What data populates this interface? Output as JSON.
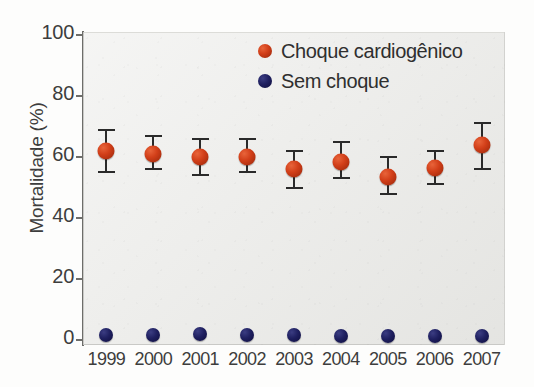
{
  "chart_data": {
    "type": "scatter",
    "title": "",
    "xlabel": "",
    "ylabel": "Mortalidade (%)",
    "categories": [
      "1999",
      "2000",
      "2001",
      "2002",
      "2003",
      "2004",
      "2005",
      "2006",
      "2007"
    ],
    "ylim": [
      0,
      100
    ],
    "yticks": [
      "0",
      "20",
      "40",
      "60",
      "80",
      "100"
    ],
    "ytick_values": [
      0,
      20,
      40,
      60,
      80,
      100
    ],
    "grid": false,
    "legend_position": "top-right",
    "error_bars": true,
    "series": [
      {
        "name": "Choque cardiogênico",
        "color": "#d23f19",
        "values": [
          62,
          61,
          60,
          60,
          56,
          58.5,
          53.5,
          56.5,
          64
        ],
        "err_low": [
          55,
          56,
          54,
          55,
          50,
          53,
          48,
          51,
          56
        ],
        "err_high": [
          69,
          67,
          66,
          66,
          62,
          65,
          60,
          62,
          71
        ]
      },
      {
        "name": "Sem choque",
        "color": "#1f2060",
        "values": [
          1.5,
          1.5,
          2,
          1.8,
          1.8,
          1.2,
          1.2,
          1.2,
          1.2
        ],
        "err_low": [
          1.5,
          1.5,
          2,
          1.8,
          1.8,
          1.2,
          1.2,
          1.2,
          1.2
        ],
        "err_high": [
          1.5,
          1.5,
          2,
          1.8,
          1.8,
          1.2,
          1.2,
          1.2,
          1.2
        ]
      }
    ]
  },
  "legend": {
    "items": [
      {
        "label": "Choque cardiogênico",
        "marker": "circle-marker-orange"
      },
      {
        "label": "Sem choque",
        "marker": "circle-marker-navy"
      }
    ]
  },
  "axes": {
    "y_title": "Mortalidade (%)"
  }
}
